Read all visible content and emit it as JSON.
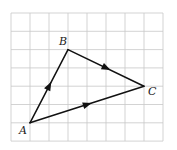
{
  "diagram": {
    "title": "",
    "grid": {
      "columns": 8,
      "rows": 7
    },
    "points": [
      {
        "id": "A",
        "label": "A",
        "col": 1,
        "row": 6
      },
      {
        "id": "B",
        "label": "B",
        "col": 3,
        "row": 2
      },
      {
        "id": "C",
        "label": "C",
        "col": 7,
        "row": 4
      }
    ],
    "edges": [
      {
        "from": "A",
        "to": "B",
        "arrow": "toward-B"
      },
      {
        "from": "B",
        "to": "C",
        "arrow": "toward-C"
      },
      {
        "from": "A",
        "to": "C",
        "arrow": "toward-C"
      }
    ],
    "colors": {
      "grid": "#c8c8c8",
      "edge": "#111111",
      "label": "#222222"
    }
  }
}
